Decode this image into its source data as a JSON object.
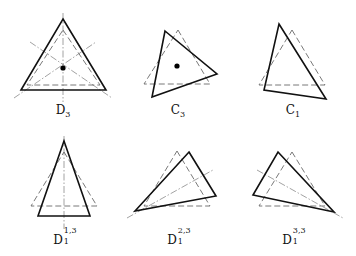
{
  "figure": {
    "panels": [
      {
        "id": "D3",
        "label": {
          "base": "D",
          "sub": "3",
          "sup": ""
        },
        "label_pos": [
          63,
          104
        ],
        "solid": [
          [
            63,
            19
          ],
          [
            106,
            90
          ],
          [
            21,
            90
          ]
        ],
        "dashed": [
          [
            63,
            30
          ],
          [
            100,
            85
          ],
          [
            27,
            85
          ]
        ],
        "axes": [
          [
            [
              63,
              13
            ],
            [
              63,
              102
            ]
          ],
          [
            [
              14,
              98
            ],
            [
              96,
              42
            ]
          ],
          [
            [
              30,
              42
            ],
            [
              112,
              98
            ]
          ]
        ],
        "center_dot": [
          63,
          68
        ]
      },
      {
        "id": "C3",
        "label": {
          "base": "C",
          "sub": "3",
          "sup": ""
        },
        "label_pos": [
          178,
          104
        ],
        "solid": [
          [
            165,
            31
          ],
          [
            217,
            74
          ],
          [
            152,
            97
          ]
        ],
        "dashed": [
          [
            178,
            30
          ],
          [
            210,
            84
          ],
          [
            144,
            84
          ]
        ],
        "axes": [],
        "center_dot": [
          177,
          66
        ]
      },
      {
        "id": "C1",
        "label": {
          "base": "C",
          "sub": "1",
          "sup": ""
        },
        "label_pos": [
          293,
          104
        ],
        "solid": [
          [
            279,
            24
          ],
          [
            326,
            99
          ],
          [
            264,
            90
          ]
        ],
        "dashed": [
          [
            292,
            30
          ],
          [
            325,
            85
          ],
          [
            259,
            85
          ]
        ],
        "axes": [],
        "center_dot": null
      },
      {
        "id": "D1_13",
        "label": {
          "base": "D",
          "sub": "1",
          "sup": "1,3"
        },
        "label_pos": [
          64,
          232
        ],
        "solid": [
          [
            64,
            141
          ],
          [
            90,
            216
          ],
          [
            38,
            216
          ]
        ],
        "dashed": [
          [
            64,
            152
          ],
          [
            97,
            206
          ],
          [
            31,
            206
          ]
        ],
        "axes": [
          [
            [
              64,
              136
            ],
            [
              64,
              229
            ]
          ]
        ],
        "center_dot": null
      },
      {
        "id": "D1_23",
        "label": {
          "base": "D",
          "sub": "1",
          "sup": "2,3"
        },
        "label_pos": [
          178,
          232
        ],
        "solid": [
          [
            189,
            152
          ],
          [
            216,
            196
          ],
          [
            135,
            211
          ]
        ],
        "dashed": [
          [
            177,
            151
          ],
          [
            210,
            206
          ],
          [
            144,
            206
          ]
        ],
        "axes": [
          [
            [
              127,
              218
            ],
            [
              213,
              170
            ]
          ]
        ],
        "center_dot": null
      },
      {
        "id": "D1_33",
        "label": {
          "base": "D",
          "sub": "1",
          "sup": "3,3"
        },
        "label_pos": [
          293,
          232
        ],
        "solid": [
          [
            278,
            152
          ],
          [
            334,
            212
          ],
          [
            253,
            195
          ]
        ],
        "dashed": [
          [
            292,
            152
          ],
          [
            325,
            206
          ],
          [
            259,
            206
          ]
        ],
        "axes": [
          [
            [
              257,
              170
            ],
            [
              343,
              218
            ]
          ]
        ],
        "center_dot": null
      }
    ],
    "labels": {
      "D3": "D3",
      "C3": "C3",
      "C1": "C1",
      "D1_13": "D1^{1,3}",
      "D1_23": "D1^{2,3}",
      "D1_33": "D1^{3,3}"
    },
    "colors": {
      "solid_stroke": "#111111",
      "dashed_stroke": "#6a6a6a",
      "axis_stroke": "#8a8a8a",
      "background": "#ffffff"
    }
  }
}
